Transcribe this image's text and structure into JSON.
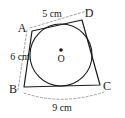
{
  "figure": {
    "background_color": "#ffffff",
    "stroke_color": "#1a1a1a",
    "dimension_line_color": "#8c8c8c",
    "vertices": [
      {
        "id": "A",
        "label": "A",
        "x": 32,
        "y": 31,
        "label_x": 22,
        "label_y": 32
      },
      {
        "id": "D",
        "label": "D",
        "x": 82,
        "y": 20,
        "label_x": 88,
        "label_y": 16
      },
      {
        "id": "C",
        "label": "C",
        "x": 100,
        "y": 85,
        "label_x": 105,
        "label_y": 90
      },
      {
        "id": "B",
        "label": "B",
        "x": 24,
        "y": 87,
        "label_x": 12,
        "label_y": 92
      }
    ],
    "center": {
      "id": "O",
      "label": "O",
      "x": 61,
      "y": 55,
      "dot_x": 61,
      "dot_y": 50,
      "dot_radius": 1.8,
      "label_x": 61,
      "label_y": 62
    },
    "incircle": {
      "cx": 61,
      "cy": 55,
      "r": 31
    },
    "quadrilateral_path": "M 32 31 L 82 20 L 100 85 L 24 87 Z",
    "dimensions": [
      {
        "id": "AD",
        "label": "5 cm",
        "value": 5,
        "unit": "cm",
        "from": "A",
        "to": "D",
        "label_x": 52,
        "label_y": 16,
        "path": "M 30 28 L 90 10"
      },
      {
        "id": "AB",
        "label": "6 cm",
        "value": 6,
        "unit": "cm",
        "from": "A",
        "to": "B",
        "label_x": 20,
        "label_y": 58,
        "path": "M 27 30 L 18 90"
      },
      {
        "id": "BC",
        "label": "9 cm",
        "value": 9,
        "unit": "cm",
        "from": "B",
        "to": "C",
        "label_x": 62,
        "label_y": 110,
        "path": "M 24 93 Q 62 106 104 92"
      }
    ]
  }
}
